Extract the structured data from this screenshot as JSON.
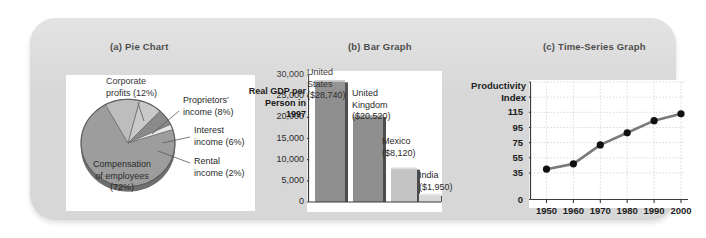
{
  "figure": {
    "panel_color": "#d7d7d7",
    "titles": {
      "a": "(a) Pie Chart",
      "b": "(b) Bar Graph",
      "c": "(c) Time-Series Graph"
    }
  },
  "chart_data": [
    {
      "type": "pie",
      "title": "(a) Pie Chart",
      "labels": [
        "Compensation of employees (72%)",
        "Corporate profits (12%)",
        "Proprietors' income (8%)",
        "Interest income (6%)",
        "Rental income (2%)"
      ],
      "label_lines": [
        [
          "Compensation",
          "of employees",
          "(72%)"
        ],
        [
          "Corporate",
          "profits (12%)"
        ],
        [
          "Proprietors'",
          "income (8%)"
        ],
        [
          "Interest",
          "income (6%)"
        ],
        [
          "Rental",
          "income (2%)"
        ]
      ],
      "values": [
        72,
        12,
        8,
        6,
        2
      ],
      "colors": [
        "#9d9d9d",
        "#bdbdbd",
        "#c9c9c9",
        "#8a8a8a",
        "#e6e6e6"
      ],
      "xlabel": "",
      "ylabel": "",
      "grid": false,
      "legend": "inline-callouts"
    },
    {
      "type": "bar",
      "title": "(b) Bar Graph",
      "ylabel": "Real GDP per Person in 1997",
      "ylabel_lines": [
        "Real GDP per",
        "Person in 1997"
      ],
      "xlabel": "",
      "categories": [
        "United States",
        "United Kingdom",
        "Mexico",
        "India"
      ],
      "category_lines": [
        [
          "United",
          "States",
          "($28,740)"
        ],
        [
          "United",
          "Kingdom",
          "($20,520)"
        ],
        [
          "Mexico",
          "($8,120)"
        ],
        [
          "India",
          "($1,950)"
        ]
      ],
      "values": [
        28740,
        20520,
        8120,
        1950
      ],
      "value_labels": [
        "$28,740",
        "$20,520",
        "$8,120",
        "$1,950"
      ],
      "colors": [
        "#8f8f8f",
        "#8f8f8f",
        "#c4c4c4",
        "#d8d8d8"
      ],
      "ylim": [
        0,
        30000
      ],
      "yticks": [
        30000,
        25000,
        20000,
        15000,
        10000,
        5000,
        0
      ],
      "ytick_labels": [
        "30,000",
        "25,000",
        "20,000",
        "15,000",
        "10,000",
        "5,000",
        "0"
      ],
      "grid": false
    },
    {
      "type": "line",
      "title": "(c) Time-Series Graph",
      "ylabel": "Productivity Index",
      "ylabel_lines": [
        "Productivity",
        "Index"
      ],
      "xlabel": "",
      "x": [
        1950,
        1960,
        1970,
        1980,
        1990,
        2000
      ],
      "xtick_labels": [
        "1950",
        "1960",
        "1970",
        "1980",
        "1990",
        "2000"
      ],
      "values": [
        40,
        47,
        72,
        88,
        104,
        113
      ],
      "ylim": [
        0,
        155
      ],
      "yticks": [
        0,
        35,
        55,
        75,
        95,
        115,
        135,
        155
      ],
      "ytick_labels": [
        "0",
        "35",
        "55",
        "75",
        "95",
        "115",
        "",
        ""
      ],
      "line_color": "#7a7a7a",
      "marker_color": "#111111",
      "grid": true
    }
  ]
}
